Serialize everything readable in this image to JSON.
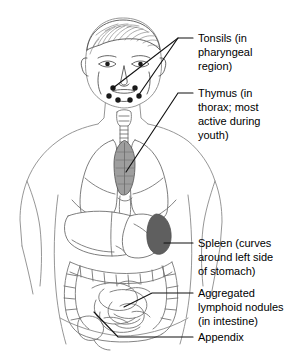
{
  "figure": {
    "background_color": "#ffffff",
    "line_color": "#6e6e6e",
    "label_color": "#000000",
    "leader_color": "#111111"
  },
  "labels": [
    {
      "id": "tonsils",
      "name": "Tonsils",
      "lines": [
        "Tonsils (in",
        "pharyngeal",
        "region)"
      ],
      "text_x": 198,
      "text_y": 42,
      "leader_start_x": 193,
      "leader_start_y": 38
    },
    {
      "id": "thymus",
      "name": "Thymus",
      "lines": [
        "Thymus (in",
        "thorax; most",
        "active during",
        "youth)"
      ],
      "text_x": 198,
      "text_y": 97,
      "leader_start_x": 193,
      "leader_start_y": 93
    },
    {
      "id": "spleen",
      "name": "Spleen",
      "lines": [
        "Spleen (curves",
        "around left side",
        "of stomach)"
      ],
      "text_x": 198,
      "text_y": 243,
      "leader_start_x": 193,
      "leader_start_y": 243
    },
    {
      "id": "aggregated-lymphoid-nodules",
      "name": "Aggregated lymphoid nodules",
      "lines": [
        "Aggregated",
        "lymphoid nodules",
        "(in intestine)"
      ],
      "text_x": 198,
      "text_y": 293,
      "leader_start_x": 193,
      "leader_start_y": 293
    },
    {
      "id": "appendix",
      "name": "Appendix",
      "lines": [
        "Appendix"
      ],
      "text_x": 198,
      "text_y": 341,
      "leader_start_x": 193,
      "leader_start_y": 337
    }
  ],
  "organs": {
    "tonsils": {
      "label": "Tonsils",
      "color": "#1a1a1a",
      "count": 6,
      "region": "pharyngeal / throat"
    },
    "thymus": {
      "label": "Thymus",
      "color": "#9a9a9a",
      "region": "thorax behind sternum"
    },
    "spleen": {
      "label": "Spleen",
      "color": "#6b6b6b",
      "region": "upper left abdomen beside stomach"
    },
    "liver": {
      "label": "Liver",
      "color": "#ffffff",
      "region": "upper right abdomen"
    },
    "lungs": {
      "label": "Lungs",
      "color": "#ffffff",
      "region": "thorax"
    },
    "intestines": {
      "label": "Intestines",
      "color": "#ffffff",
      "region": "lower abdomen"
    },
    "appendix": {
      "label": "Appendix",
      "color": "#ffffff",
      "region": "lower right abdomen"
    }
  }
}
